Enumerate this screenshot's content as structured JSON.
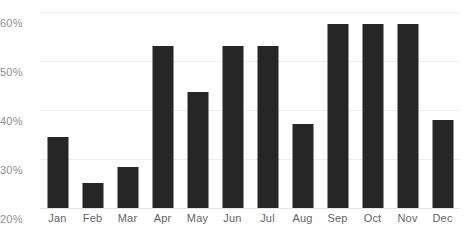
{
  "chart_data": {
    "type": "bar",
    "title": "",
    "xlabel": "",
    "ylabel": "",
    "ylim": [
      20,
      60
    ],
    "grid": true,
    "legend": null,
    "y_ticks": [
      "20%",
      "30%",
      "40%",
      "50%",
      "60%"
    ],
    "y_tick_values": [
      20,
      30,
      40,
      50,
      60
    ],
    "categories": [
      "Jan",
      "Feb",
      "Mar",
      "Apr",
      "May",
      "Jun",
      "Jul",
      "Aug",
      "Sep",
      "Oct",
      "Nov",
      "Dec"
    ],
    "values": [
      34.4,
      25.1,
      28.4,
      53.1,
      43.7,
      53.1,
      53.1,
      37.1,
      57.6,
      57.6,
      57.6,
      38.0
    ],
    "bar_color": "#262626",
    "gridline_color": "#eeeef1",
    "tick_label_color": "#8e8e96"
  }
}
